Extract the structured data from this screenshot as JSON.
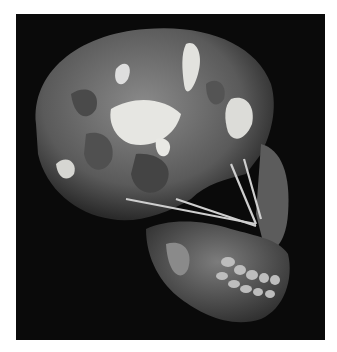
{
  "image": {
    "subject": "reconstructed fossil hominin skull, lateral view",
    "style": "grayscale photograph",
    "background_color": "#0a0a0a",
    "page_color": "#ffffff",
    "tones": {
      "bone_dark": "#3a3a3a",
      "bone_mid": "#6e6e6e",
      "bone_light": "#9a9a9a",
      "plaster": "#e6e6e2",
      "teeth": "#bdbdbd",
      "rods": "#cfcfcf"
    }
  }
}
